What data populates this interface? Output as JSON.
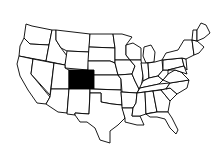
{
  "map": {
    "title": "United States map",
    "highlighted_state": "Colorado",
    "highlight_color": "#000000",
    "background_color": "#ffffff",
    "outline_color": "#000000"
  }
}
